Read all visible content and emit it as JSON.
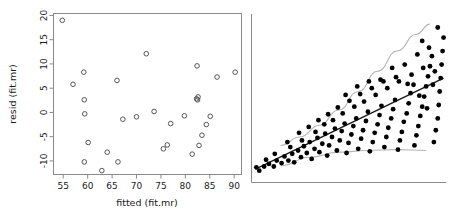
{
  "figure": {
    "background_color": "#ffffff",
    "panel_count": 2,
    "axis_color": "#8a8a8a",
    "point_color_left": "#555555",
    "point_color_right": "#000000",
    "band_color": "#b5b5b5",
    "fit_line_color": "#1a1a1a"
  },
  "chart_data": [
    {
      "type": "scatter",
      "panel": "left",
      "title": "",
      "xlabel": "fitted (fit.mr)",
      "ylabel": "resid (fit.mr)",
      "xlim": [
        53.0,
        91.5
      ],
      "ylim": [
        -12.8,
        20.4
      ],
      "xticks": [
        55,
        60,
        65,
        70,
        75,
        80,
        85,
        90
      ],
      "yticks": [
        -10,
        -5,
        0,
        5,
        10,
        15,
        20
      ],
      "grid": false,
      "legend": null,
      "marker": "open-circle",
      "points": [
        [
          54.8,
          19.0
        ],
        [
          57.0,
          5.8
        ],
        [
          59.2,
          8.3
        ],
        [
          59.3,
          2.6
        ],
        [
          59.4,
          -0.3
        ],
        [
          59.3,
          -10.2
        ],
        [
          60.1,
          -6.2
        ],
        [
          62.9,
          -12.0
        ],
        [
          64.0,
          -8.2
        ],
        [
          66.0,
          6.6
        ],
        [
          66.2,
          -10.2
        ],
        [
          67.2,
          -1.4
        ],
        [
          70.0,
          -0.9
        ],
        [
          72.0,
          12.1
        ],
        [
          73.6,
          0.2
        ],
        [
          75.5,
          -7.5
        ],
        [
          76.3,
          -6.7
        ],
        [
          77.0,
          -2.3
        ],
        [
          79.8,
          -0.7
        ],
        [
          81.4,
          -8.6
        ],
        [
          82.3,
          2.8
        ],
        [
          82.6,
          3.2
        ],
        [
          82.5,
          2.6
        ],
        [
          82.4,
          9.6
        ],
        [
          82.8,
          -6.8
        ],
        [
          83.4,
          -4.7
        ],
        [
          84.3,
          -2.5
        ],
        [
          85.1,
          -0.8
        ],
        [
          86.5,
          7.3
        ],
        [
          90.2,
          8.3
        ]
      ]
    },
    {
      "type": "scatter",
      "panel": "right",
      "title": "",
      "xlabel": "",
      "ylabel": "",
      "xlim": [
        0,
        100
      ],
      "ylim": [
        0,
        100
      ],
      "xticks": [],
      "yticks": [],
      "grid": false,
      "legend": null,
      "marker": "filled-circle",
      "annotations": [
        "fitted regression line (solid, dark)",
        "upper reference band (light grey, curving up)",
        "lower reference band (light grey, nearly flat)"
      ],
      "fit_line": {
        "x": [
          2,
          99
        ],
        "y": [
          8,
          62
        ]
      },
      "upper_band": [
        [
          15,
          22
        ],
        [
          25,
          27
        ],
        [
          35,
          34
        ],
        [
          45,
          43
        ],
        [
          55,
          54
        ],
        [
          65,
          66
        ],
        [
          75,
          78
        ],
        [
          85,
          88
        ],
        [
          92,
          94
        ]
      ],
      "lower_band": [
        [
          15,
          10
        ],
        [
          30,
          15
        ],
        [
          45,
          18
        ],
        [
          60,
          19
        ],
        [
          75,
          19.5
        ],
        [
          90,
          19
        ]
      ],
      "points": [
        [
          2.5,
          9.0
        ],
        [
          4.0,
          7.0
        ],
        [
          6.5,
          9.5
        ],
        [
          9.0,
          11.0
        ],
        [
          11.5,
          9.5
        ],
        [
          13.0,
          13.0
        ],
        [
          15.5,
          11.5
        ],
        [
          17.0,
          15.5
        ],
        [
          19.0,
          13.0
        ],
        [
          21.0,
          17.0
        ],
        [
          22.0,
          12.0
        ],
        [
          24.0,
          19.0
        ],
        [
          25.5,
          15.0
        ],
        [
          27.0,
          21.5
        ],
        [
          28.5,
          17.5
        ],
        [
          30.0,
          24.0
        ],
        [
          31.0,
          14.0
        ],
        [
          32.5,
          20.0
        ],
        [
          34.0,
          26.5
        ],
        [
          35.0,
          18.0
        ],
        [
          36.5,
          23.0
        ],
        [
          38.0,
          29.0
        ],
        [
          39.0,
          16.0
        ],
        [
          40.0,
          22.0
        ],
        [
          41.5,
          27.0
        ],
        [
          43.0,
          32.0
        ],
        [
          44.0,
          19.0
        ],
        [
          45.5,
          25.0
        ],
        [
          46.5,
          30.5
        ],
        [
          48.0,
          35.0
        ],
        [
          49.0,
          17.5
        ],
        [
          50.0,
          23.5
        ],
        [
          51.5,
          28.5
        ],
        [
          52.5,
          33.5
        ],
        [
          54.0,
          38.0
        ],
        [
          55.0,
          20.0
        ],
        [
          56.5,
          26.0
        ],
        [
          57.5,
          31.0
        ],
        [
          59.0,
          36.5
        ],
        [
          60.0,
          42.0
        ],
        [
          61.0,
          18.5
        ],
        [
          62.5,
          24.0
        ],
        [
          63.5,
          29.5
        ],
        [
          65.0,
          34.5
        ],
        [
          66.0,
          40.0
        ],
        [
          67.0,
          45.5
        ],
        [
          68.5,
          21.0
        ],
        [
          69.5,
          27.0
        ],
        [
          70.5,
          32.5
        ],
        [
          72.0,
          38.0
        ],
        [
          73.0,
          43.5
        ],
        [
          74.0,
          49.0
        ],
        [
          75.5,
          19.5
        ],
        [
          76.5,
          25.0
        ],
        [
          77.5,
          30.0
        ],
        [
          78.5,
          36.0
        ],
        [
          80.0,
          41.0
        ],
        [
          81.0,
          47.0
        ],
        [
          82.0,
          53.0
        ],
        [
          83.5,
          58.0
        ],
        [
          84.0,
          22.0
        ],
        [
          85.0,
          28.0
        ],
        [
          86.0,
          33.5
        ],
        [
          87.0,
          39.5
        ],
        [
          88.0,
          45.0
        ],
        [
          89.0,
          51.0
        ],
        [
          90.0,
          57.0
        ],
        [
          91.0,
          63.0
        ],
        [
          92.0,
          69.0
        ],
        [
          93.0,
          75.0
        ],
        [
          94.0,
          24.0
        ],
        [
          95.0,
          31.0
        ],
        [
          96.0,
          38.0
        ],
        [
          96.5,
          46.0
        ],
        [
          97.0,
          54.0
        ],
        [
          97.5,
          62.0
        ],
        [
          98.0,
          70.0
        ],
        [
          98.5,
          78.0
        ],
        [
          99.0,
          86.0
        ],
        [
          96.0,
          92.0
        ],
        [
          20.0,
          21.0
        ],
        [
          26.0,
          25.0
        ],
        [
          33.0,
          30.0
        ],
        [
          37.5,
          34.5
        ],
        [
          42.0,
          37.0
        ],
        [
          47.0,
          41.0
        ],
        [
          53.0,
          45.0
        ],
        [
          58.0,
          48.0
        ],
        [
          64.0,
          52.0
        ],
        [
          70.0,
          56.0
        ],
        [
          76.0,
          60.0
        ],
        [
          82.5,
          64.0
        ],
        [
          88.5,
          68.0
        ],
        [
          93.5,
          58.0
        ],
        [
          90.5,
          44.0
        ],
        [
          86.5,
          51.5
        ],
        [
          80.5,
          58.5
        ],
        [
          74.5,
          62.5
        ],
        [
          68.0,
          60.0
        ],
        [
          62.0,
          56.0
        ],
        [
          56.0,
          52.5
        ],
        [
          50.5,
          48.5
        ],
        [
          44.5,
          44.5
        ],
        [
          39.5,
          40.5
        ],
        [
          34.5,
          37.0
        ],
        [
          29.5,
          33.0
        ],
        [
          24.5,
          29.5
        ],
        [
          18.5,
          24.0
        ],
        [
          12.0,
          17.0
        ],
        [
          7.5,
          13.5
        ],
        [
          85.5,
          76.0
        ],
        [
          91.5,
          80.0
        ],
        [
          88.0,
          84.0
        ],
        [
          94.5,
          66.0
        ],
        [
          79.0,
          70.0
        ],
        [
          72.5,
          68.0
        ],
        [
          66.5,
          61.0
        ],
        [
          60.5,
          60.0
        ],
        [
          54.5,
          57.0
        ],
        [
          48.5,
          52.0
        ]
      ]
    }
  ],
  "labels": {
    "left_x_title": "fitted (fit.mr)",
    "left_y_title": "resid (fit.mr)",
    "left_xticks": [
      "55",
      "60",
      "65",
      "70",
      "75",
      "80",
      "85",
      "90"
    ],
    "left_yticks": [
      "-10",
      "-5",
      "0",
      "5",
      "10",
      "15",
      "20"
    ]
  }
}
